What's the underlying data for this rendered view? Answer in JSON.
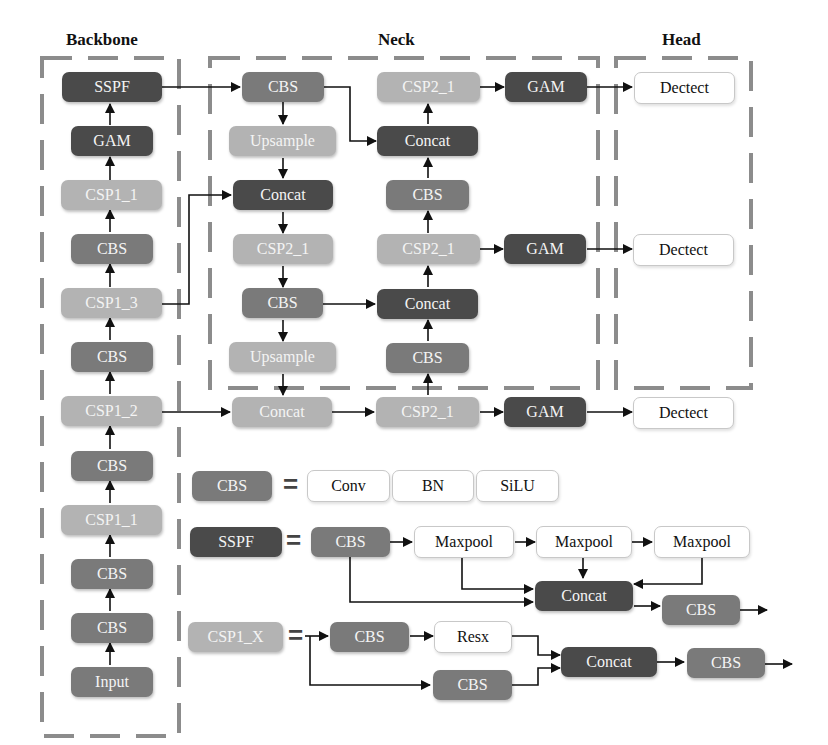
{
  "titles": {
    "backbone": "Backbone",
    "neck": "Neck",
    "head": "Head"
  },
  "backbone": {
    "nodes": [
      "SSPF",
      "GAM",
      "CSP1_1",
      "CBS",
      "CSP1_3",
      "CBS",
      "CSP1_2",
      "CBS",
      "CSP1_1",
      "CBS",
      "CBS",
      "Input"
    ]
  },
  "neck": {
    "left_column": [
      "CBS",
      "Upsample",
      "Concat",
      "CSP2_1",
      "CBS",
      "Upsample",
      "Concat"
    ],
    "right_column": [
      "CSP2_1",
      "Concat",
      "CBS",
      "CSP2_1",
      "Concat",
      "CBS",
      "CSP2_1"
    ],
    "gam": [
      "GAM",
      "GAM",
      "GAM"
    ]
  },
  "head": {
    "outputs": [
      "Dectect",
      "Dectect",
      "Dectect"
    ]
  },
  "legend": {
    "cbs": {
      "label": "CBS",
      "equals": "=",
      "parts": [
        "Conv",
        "BN",
        "SiLU"
      ]
    },
    "sspf": {
      "label": "SSPF",
      "equals": "=",
      "cbs": "CBS",
      "maxpools": [
        "Maxpool",
        "Maxpool",
        "Maxpool"
      ],
      "concat": "Concat",
      "out_cbs": "CBS"
    },
    "csp1x": {
      "label": "CSP1_X",
      "equals": "=",
      "cbs_top": "CBS",
      "resx": "Resx",
      "cbs_bottom": "CBS",
      "concat": "Concat",
      "out_cbs": "CBS"
    }
  },
  "colors": {
    "dark": "#4a4a4a",
    "mid": "#7a7a7a",
    "light": "#b3b3b3",
    "dashed_border": "#8a8a8a"
  }
}
